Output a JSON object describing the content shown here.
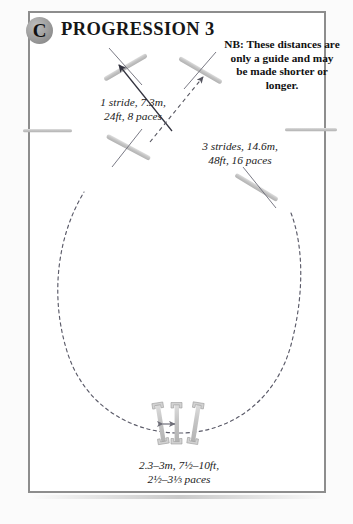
{
  "page": {
    "badge_letter": "C",
    "title": "PROGRESSION 3",
    "background": "#ffffff",
    "frame_color": "#8d8d8d",
    "pole_color": "#c9c9c9",
    "line_color": "#3a3a4a"
  },
  "note": {
    "text": "NB: These distances are only a guide and may be made shorter or longer."
  },
  "labels": {
    "stride_1": "1 stride, 7.3m,\n24ft, 8 paces",
    "stride_3": "3 strides, 14.6m,\n48ft, 16 paces",
    "spread": "2.3–3m, 7½–10ft,\n2½–3⅓ paces"
  },
  "diagram": {
    "course_line_style": "dashed-oval",
    "approach_arrow": "solid",
    "exit_arrow": "dashed",
    "jump_count": 4,
    "ground_pole_count": 3,
    "side_marker_count": 2
  },
  "icon_names": [
    "circled-letter-badge",
    "jump-pole-icon",
    "ground-pole-icon",
    "side-marker-icon",
    "dashed-course-line",
    "solid-direction-arrow",
    "dashed-direction-arrow",
    "double-headed-measure-arrow"
  ]
}
